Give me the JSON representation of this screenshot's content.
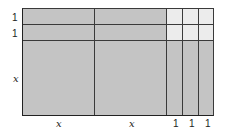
{
  "diagram": {
    "row_labels": [
      "1",
      "1",
      "x"
    ],
    "column_labels": [
      "x",
      "x",
      "1",
      "1",
      "1"
    ],
    "colors": {
      "x_tile": "#c4c4c4",
      "unit_tile": "#ececec",
      "border": "#3a3a3a"
    }
  }
}
